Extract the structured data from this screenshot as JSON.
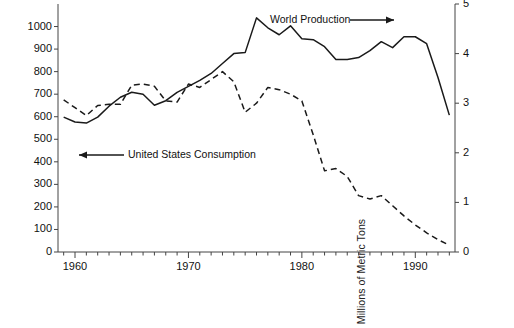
{
  "chart_data": {
    "type": "line",
    "title": "",
    "xlabel": "",
    "ylabel": "Thousands of Metric Tons",
    "ylabel_right": "Millions of Metric Tons",
    "xlim": [
      1958.5,
      1993.5
    ],
    "ylim": [
      0,
      1100
    ],
    "ylim_right": [
      0,
      5
    ],
    "grid": false,
    "legend_position": "inline-annotations",
    "yticks": [
      0,
      100,
      200,
      300,
      400,
      500,
      600,
      700,
      800,
      900,
      1000
    ],
    "yticklabels": [
      "0",
      "100",
      "200",
      "300",
      "400",
      "500",
      "600",
      "700",
      "800",
      "900",
      "1000"
    ],
    "yticks_right": [
      0,
      1,
      2,
      3,
      4,
      5
    ],
    "yticklabels_right": [
      "0",
      "1",
      "2",
      "3",
      "4",
      "5"
    ],
    "xticks_labeled": [
      1960,
      1970,
      1980,
      1990
    ],
    "xticklabels": [
      "1960",
      "1970",
      "1980",
      "1990"
    ],
    "x": [
      1959,
      1960,
      1961,
      1962,
      1963,
      1964,
      1965,
      1966,
      1967,
      1968,
      1969,
      1970,
      1971,
      1972,
      1973,
      1974,
      1975,
      1976,
      1977,
      1978,
      1979,
      1980,
      1981,
      1982,
      1983,
      1984,
      1985,
      1986,
      1987,
      1988,
      1989,
      1990,
      1991,
      1992,
      1993
    ],
    "series": [
      {
        "name": "World Production",
        "axis": "right",
        "units": "Millions of Metric Tons",
        "style": "solid",
        "color": "#1a1a1a",
        "values": [
          2.72,
          2.62,
          2.6,
          2.72,
          2.94,
          3.12,
          3.22,
          3.18,
          2.96,
          3.05,
          3.22,
          3.34,
          3.46,
          3.6,
          3.8,
          4.0,
          4.02,
          4.72,
          4.52,
          4.38,
          4.56,
          4.3,
          4.28,
          4.14,
          3.88,
          3.88,
          3.92,
          4.06,
          4.24,
          4.12,
          4.34,
          4.34,
          4.2,
          3.52,
          2.76
        ]
      },
      {
        "name": "United States Consumption",
        "axis": "left",
        "units": "Thousands of Metric Tons",
        "style": "dashed",
        "color": "#1a1a1a",
        "values": [
          675,
          640,
          605,
          650,
          655,
          655,
          740,
          745,
          735,
          670,
          665,
          745,
          730,
          765,
          800,
          755,
          620,
          660,
          730,
          720,
          700,
          670,
          520,
          360,
          370,
          335,
          250,
          235,
          250,
          205,
          160,
          120,
          85,
          55,
          30
        ]
      }
    ],
    "annotations": [
      {
        "text": "World Production",
        "arrow": "right",
        "target_series": "World Production"
      },
      {
        "text": "United States Consumption",
        "arrow": "left",
        "target_series": "United States Consumption"
      }
    ]
  },
  "axes": {
    "left_title": "Thousands of Metric Tons",
    "right_title": "Millions of Metric Tons"
  }
}
